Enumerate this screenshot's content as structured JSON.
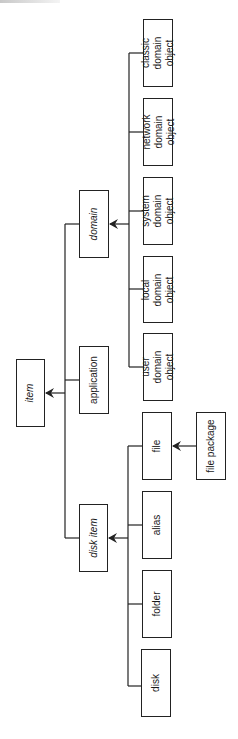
{
  "diagram": {
    "type": "class-hierarchy",
    "orientation": "rotated-90-ccw",
    "root": "item",
    "nodes": {
      "item": {
        "label": "item",
        "italic": true
      },
      "application": {
        "label": "application",
        "italic": false
      },
      "domain": {
        "label": "domain",
        "italic": true
      },
      "disk_item": {
        "label": "disk item",
        "italic": true
      },
      "user_domain_object": {
        "label": "user domain\nobject",
        "italic": false
      },
      "local_domain_object": {
        "label": "local domain\nobject",
        "italic": false
      },
      "system_domain_object": {
        "label": "system domain\nobject",
        "italic": false
      },
      "network_domain_object": {
        "label": "network domain\nobject",
        "italic": false
      },
      "classic_domain_object": {
        "label": "classic domain\nobject",
        "italic": false
      },
      "file": {
        "label": "file",
        "italic": false
      },
      "alias": {
        "label": "alias",
        "italic": false
      },
      "folder": {
        "label": "folder",
        "italic": false
      },
      "disk": {
        "label": "disk",
        "italic": false
      },
      "file_package": {
        "label": "file package",
        "italic": false
      }
    },
    "edges": [
      {
        "from": "application",
        "to": "item"
      },
      {
        "from": "domain",
        "to": "item"
      },
      {
        "from": "disk_item",
        "to": "item"
      },
      {
        "from": "user_domain_object",
        "to": "domain"
      },
      {
        "from": "local_domain_object",
        "to": "domain"
      },
      {
        "from": "system_domain_object",
        "to": "domain"
      },
      {
        "from": "network_domain_object",
        "to": "domain"
      },
      {
        "from": "classic_domain_object",
        "to": "domain"
      },
      {
        "from": "file",
        "to": "disk_item"
      },
      {
        "from": "alias",
        "to": "disk_item"
      },
      {
        "from": "folder",
        "to": "disk_item"
      },
      {
        "from": "disk",
        "to": "disk_item"
      },
      {
        "from": "file_package",
        "to": "file"
      }
    ],
    "colors": {
      "line": "#222222",
      "box_border": "#222222",
      "background": "#ffffff"
    }
  }
}
